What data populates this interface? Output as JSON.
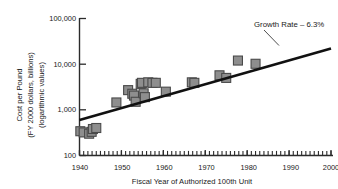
{
  "chart_data": {
    "type": "scatter",
    "title": "",
    "xlabel": "Fiscal Year of Authorized 100th Unit",
    "ylabel": "Cost per Pound\n(FY 2000 dollars, billions)\n(logarithmic values)",
    "ylabel_lines": [
      "Cost per Pound",
      "(FY 2000 dollars, billions)",
      "(logarithmic values)"
    ],
    "yscale": "log",
    "xscale": "linear",
    "xlim": [
      1940,
      2000
    ],
    "ylim": [
      100,
      100000
    ],
    "grid": false,
    "legend": null,
    "x_ticks": [
      1940,
      1950,
      1960,
      1970,
      1980,
      1990,
      2000
    ],
    "x_tick_labels": [
      "1940",
      "1950",
      "1960",
      "1970",
      "1980",
      "1990",
      "2000"
    ],
    "x_minor_tick_interval": 1,
    "y_ticks": [
      100,
      1000,
      10000,
      100000
    ],
    "y_tick_labels": [
      "100",
      "1,000",
      "10,000",
      "100,000"
    ],
    "marker_shape": "square",
    "marker_color": "#8e8e8e",
    "marker_edge_color": "#4a4a4a",
    "points": [
      {
        "x": 1940.2,
        "y": 340
      },
      {
        "x": 1941.0,
        "y": 320
      },
      {
        "x": 1942.3,
        "y": 300
      },
      {
        "x": 1942.9,
        "y": 330
      },
      {
        "x": 1943.2,
        "y": 380
      },
      {
        "x": 1944.0,
        "y": 400
      },
      {
        "x": 1948.8,
        "y": 1450
      },
      {
        "x": 1951.6,
        "y": 2700
      },
      {
        "x": 1952.6,
        "y": 2250
      },
      {
        "x": 1953.0,
        "y": 2050
      },
      {
        "x": 1953.4,
        "y": 1500
      },
      {
        "x": 1954.6,
        "y": 3700
      },
      {
        "x": 1954.9,
        "y": 3900
      },
      {
        "x": 1955.3,
        "y": 2300
      },
      {
        "x": 1955.6,
        "y": 1900
      },
      {
        "x": 1956.4,
        "y": 4000
      },
      {
        "x": 1957.4,
        "y": 3900
      },
      {
        "x": 1958.2,
        "y": 3900
      },
      {
        "x": 1960.6,
        "y": 2500
      },
      {
        "x": 1966.8,
        "y": 4000
      },
      {
        "x": 1967.4,
        "y": 3900
      },
      {
        "x": 1973.4,
        "y": 5700
      },
      {
        "x": 1975.0,
        "y": 5000
      },
      {
        "x": 1977.8,
        "y": 12000
      },
      {
        "x": 1982.0,
        "y": 10200
      }
    ],
    "trend_line": {
      "label": "Growth Rate – 6.3%",
      "growth_rate_percent": 6.3,
      "x_start": 1940,
      "y_start": 600,
      "x_end": 2000,
      "y_end": 22000,
      "color": "#111111"
    },
    "annotation": {
      "text": "Growth Rate – 6.3%",
      "x_text": 1981,
      "y_text": 42000
    }
  }
}
